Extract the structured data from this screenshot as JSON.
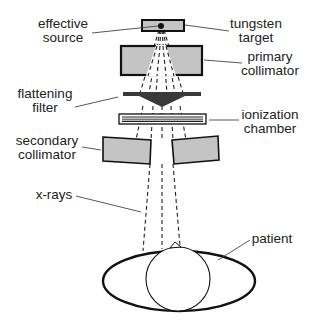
{
  "diagram": {
    "type": "linac-treatment-head-schematic",
    "colors": {
      "outline": "#111111",
      "component_fill": "#c4c4c4",
      "filter_fill": "#3a3a3a",
      "label_text": "#222222",
      "leader_line": "#444444",
      "background": "#ffffff"
    },
    "labels": {
      "effective_source": {
        "line1": "effective",
        "line2": "source"
      },
      "tungsten_target": {
        "line1": "tungsten",
        "line2": "target"
      },
      "primary_collimator": {
        "line1": "primary",
        "line2": "collimator"
      },
      "flattening_filter": {
        "line1": "flattening",
        "line2": "filter"
      },
      "ionization_chamber": {
        "line1": "ionization",
        "line2": "chamber"
      },
      "secondary_collimator": {
        "line1": "secondary",
        "line2": "collimator"
      },
      "x_rays": {
        "line1": "x-rays"
      },
      "patient": {
        "line1": "patient"
      }
    }
  }
}
